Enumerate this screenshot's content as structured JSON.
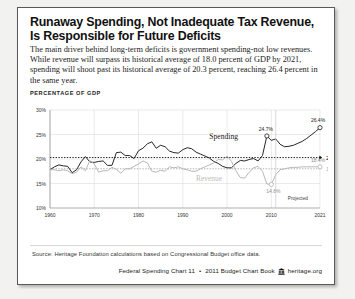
{
  "card": {
    "title": "Runaway Spending, Not Inadequate Tax Revenue, Is Responsible for Future Deficits",
    "subtitle": "The main driver behind long-term deficits is government spending-not low revenues. While revenue will surpass its historical average of 18.0 percent of GDP by 2021, spending will shoot past its historical average of 20.3 percent, reaching 26.4 percent in the same year.",
    "axis_caption": "PERCENTAGE OF GDP",
    "source": "Source: Heritage Foundation calculations based on Congressional Budget office data.",
    "footer": {
      "chart_ref": "Federal Spending Chart 11",
      "separator": "•",
      "book": "2011 Budget Chart Book",
      "logo_icon": "heritage-building-icon",
      "site": "heritage.org"
    }
  },
  "chart_data": {
    "type": "line",
    "title": "Runaway Spending, Not Inadequate Tax Revenue, Is Responsible for Future Deficits",
    "xlabel": "",
    "ylabel": "PERCENTAGE OF GDP",
    "xlim": [
      1960,
      2021
    ],
    "ylim": [
      10,
      30
    ],
    "yticks": [
      10,
      15,
      20,
      25,
      30
    ],
    "ytick_labels": [
      "10%",
      "15%",
      "20%",
      "25%",
      "30%"
    ],
    "xticks": [
      1960,
      1970,
      1980,
      1990,
      2000,
      2010,
      2021
    ],
    "xtick_labels": [
      "1960",
      "1970",
      "1980",
      "1990",
      "2000",
      "2010",
      "2021"
    ],
    "grid": true,
    "legend": "inline-labels",
    "projection_start": 2011,
    "projection_note": "Projected",
    "reference_lines": [
      {
        "name": "historical-average-spending",
        "value": 20.3,
        "label": "20.3% Spending",
        "style": "dotted",
        "color": "#111111"
      },
      {
        "name": "historical-average-revenue",
        "value": 18.0,
        "label": "18.0% Revenue",
        "style": "dotted",
        "color": "#a8a8a8"
      }
    ],
    "annotations": [
      {
        "name": "spending-2009-peak",
        "x": 2009,
        "y": 24.7,
        "label": "24.7%"
      },
      {
        "name": "spending-2021-end",
        "x": 2021,
        "y": 26.4,
        "label": "26.4%"
      },
      {
        "name": "revenue-2010-trough",
        "x": 2010,
        "y": 14.8,
        "label": "14.8%"
      },
      {
        "name": "revenue-2021-end",
        "x": 2021,
        "y": 18.4,
        "label": "18.4%"
      }
    ],
    "series": [
      {
        "name": "Spending",
        "color": "#1a1a1a",
        "inline_label": "Spending",
        "x": [
          1960,
          1961,
          1962,
          1963,
          1964,
          1965,
          1966,
          1967,
          1968,
          1969,
          1970,
          1971,
          1972,
          1973,
          1974,
          1975,
          1976,
          1977,
          1978,
          1979,
          1980,
          1981,
          1982,
          1983,
          1984,
          1985,
          1986,
          1987,
          1988,
          1989,
          1990,
          1991,
          1992,
          1993,
          1994,
          1995,
          1996,
          1997,
          1998,
          1999,
          2000,
          2001,
          2002,
          2003,
          2004,
          2005,
          2006,
          2007,
          2008,
          2009,
          2010,
          2011,
          2012,
          2013,
          2014,
          2015,
          2016,
          2017,
          2018,
          2019,
          2020,
          2021
        ],
        "values": [
          17.8,
          18.4,
          18.8,
          18.6,
          18.5,
          17.2,
          17.8,
          19.4,
          20.5,
          19.4,
          19.3,
          19.5,
          19.6,
          18.7,
          18.7,
          21.3,
          21.4,
          20.7,
          20.7,
          20.1,
          21.7,
          22.2,
          23.1,
          23.5,
          22.2,
          22.8,
          22.5,
          21.6,
          21.3,
          21.2,
          21.9,
          22.3,
          22.1,
          21.4,
          21.0,
          20.6,
          20.2,
          19.5,
          19.1,
          18.5,
          18.2,
          18.2,
          19.1,
          19.7,
          19.6,
          19.9,
          20.1,
          19.6,
          20.7,
          24.7,
          23.8,
          24.1,
          23.0,
          22.5,
          22.6,
          22.8,
          23.2,
          23.6,
          24.2,
          24.9,
          25.6,
          26.4
        ]
      },
      {
        "name": "Revenue",
        "color": "#b3b3b3",
        "inline_label": "Revenue",
        "x": [
          1960,
          1961,
          1962,
          1963,
          1964,
          1965,
          1966,
          1967,
          1968,
          1969,
          1970,
          1971,
          1972,
          1973,
          1974,
          1975,
          1976,
          1977,
          1978,
          1979,
          1980,
          1981,
          1982,
          1983,
          1984,
          1985,
          1986,
          1987,
          1988,
          1989,
          1990,
          1991,
          1992,
          1993,
          1994,
          1995,
          1996,
          1997,
          1998,
          1999,
          2000,
          2001,
          2002,
          2003,
          2004,
          2005,
          2006,
          2007,
          2008,
          2009,
          2010,
          2011,
          2012,
          2013,
          2014,
          2015,
          2016,
          2017,
          2018,
          2019,
          2020,
          2021
        ],
        "values": [
          17.8,
          17.8,
          17.6,
          17.8,
          17.6,
          17.0,
          17.3,
          18.4,
          17.6,
          19.7,
          19.0,
          17.3,
          17.6,
          17.6,
          18.3,
          17.9,
          17.1,
          18.0,
          18.0,
          18.5,
          19.0,
          19.6,
          19.2,
          17.5,
          17.3,
          17.7,
          17.5,
          18.4,
          18.2,
          18.4,
          18.0,
          17.8,
          17.5,
          17.5,
          18.0,
          18.4,
          18.8,
          19.2,
          19.9,
          19.8,
          20.6,
          19.5,
          17.6,
          16.2,
          16.1,
          17.3,
          18.2,
          18.5,
          17.5,
          14.9,
          14.8,
          16.8,
          17.8,
          18.0,
          18.2,
          18.3,
          18.3,
          18.4,
          18.4,
          18.4,
          18.4,
          18.4
        ]
      }
    ]
  }
}
